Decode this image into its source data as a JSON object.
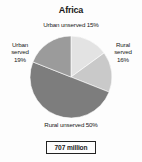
{
  "chart_data": {
    "type": "pie",
    "title": "Africa",
    "xlabel": "",
    "ylabel": "",
    "legend_position": "around-slices",
    "grid": false,
    "total_label": "707 million",
    "categories": [
      "Urban unserved",
      "Rural served",
      "Rural unserved",
      "Urban served"
    ],
    "values": [
      15,
      16,
      50,
      19
    ],
    "value_unit": "%",
    "slices": [
      {
        "name": "Urban unserved",
        "value": 15,
        "label": "Urban unserved 15%",
        "color": "#e3e3e3",
        "position": "top"
      },
      {
        "name": "Rural served",
        "value": 16,
        "label_lines": [
          "Rural",
          "served",
          "16%"
        ],
        "color": "#c9c9c9",
        "position": "right"
      },
      {
        "name": "Rural unserved",
        "value": 50,
        "label": "Rural unserved 50%",
        "color": "#7d7d7d",
        "position": "bottom"
      },
      {
        "name": "Urban served",
        "value": 19,
        "label_lines": [
          "Urban",
          "served",
          "19%"
        ],
        "color": "#9b9b9b",
        "position": "left"
      }
    ]
  },
  "labels": {
    "urban_unserved": "Urban unserved 15%",
    "urban_served_line1": "Urban",
    "urban_served_line2": "served",
    "urban_served_line3": "19%",
    "rural_served_line1": "Rural",
    "rural_served_line2": "served",
    "rural_served_line3": "16%",
    "rural_unserved": "Rural unserved 50%"
  },
  "total": {
    "text": "707 million"
  },
  "colors": {
    "urban_unserved": "#e3e3e3",
    "rural_served": "#c9c9c9",
    "rural_unserved": "#7d7d7d",
    "urban_served": "#9b9b9b",
    "background": "#fdfdfd",
    "text": "#1a1a1a",
    "box_border": "#222222"
  }
}
